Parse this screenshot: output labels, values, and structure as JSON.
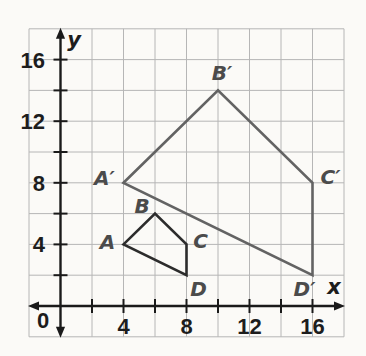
{
  "figure": {
    "background": "#fbfaf7",
    "grid_color": "#b6b6b6",
    "axis_color": "#1a1a1a",
    "number_color": "#1d1d1d",
    "vertex_label_color": "#4b4b4b"
  },
  "chart_data": {
    "type": "line",
    "subtype": "polygon-dilation-graph",
    "xlabel": "x",
    "ylabel": "y",
    "xlim": [
      -2,
      18
    ],
    "ylim": [
      -2,
      18
    ],
    "grid": true,
    "grid_step": 2,
    "tick_step": 2,
    "x_tick_labels": [
      4,
      8,
      12,
      16
    ],
    "y_tick_labels": [
      4,
      8,
      12,
      16
    ],
    "origin_label": "0",
    "polygons": [
      {
        "name": "preimage-quadrilateral-ABCD",
        "color": "#2c2c2c",
        "closed": true,
        "vertices": [
          {
            "label": "A",
            "x": 4,
            "y": 4
          },
          {
            "label": "B",
            "x": 6,
            "y": 6
          },
          {
            "label": "C",
            "x": 8,
            "y": 4
          },
          {
            "label": "D",
            "x": 8,
            "y": 2
          }
        ]
      },
      {
        "name": "image-quadrilateral-A'B'C'D'",
        "color": "#636363",
        "closed": true,
        "vertices": [
          {
            "label": "A′",
            "x": 4,
            "y": 8
          },
          {
            "label": "B′",
            "x": 10,
            "y": 14
          },
          {
            "label": "C′",
            "x": 16,
            "y": 8
          },
          {
            "label": "D′",
            "x": 16,
            "y": 2
          }
        ]
      }
    ]
  }
}
